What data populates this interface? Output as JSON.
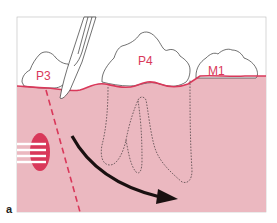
{
  "figure": {
    "panel_label": "a",
    "teeth": [
      {
        "label": "P3"
      },
      {
        "label": "P4"
      },
      {
        "label": "M1"
      }
    ],
    "colors": {
      "gum_fill": "#ebb8c0",
      "gum_line": "#d9385a",
      "label": "#d9385a",
      "arrow": "#1a1010",
      "outline": "#333333",
      "background": "#ffffff"
    },
    "elements": {
      "scalpel": "scalpel-blade",
      "incision": "dashed-vertical-incision",
      "roots": "dotted-root-outlines",
      "arrow": "rotation-arrow",
      "suture_site": "striped-ellipse"
    }
  }
}
